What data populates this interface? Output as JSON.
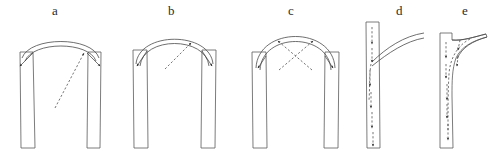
{
  "figure": {
    "background_color": "#ffffff",
    "line_color": "#4a4a4a",
    "masonry_stroke_color": "#5a5a5a",
    "arrow_color": "#2a2a2a",
    "label_color": "#2b2b2b",
    "width": 489,
    "height": 162
  },
  "panels": [
    {
      "id": "a",
      "label": "a",
      "label_x": 52,
      "label_y": 4,
      "type": "round-arch-on-piers",
      "description": "Shallow round arch spanning two vertical piers with thrust arrows pointing outward and downward at the springings and a single dashed thrust line from mid-span to the right haunch",
      "arrow_count": 3,
      "dashed_arrow_count": 1
    },
    {
      "id": "b",
      "label": "b",
      "label_x": 168,
      "label_y": 4,
      "type": "pointed-arch-on-piers",
      "description": "Steeper double-ribbed arch on two piers with outward thrust arrows at both springings and a dashed arrow from mid-span to the right haunch",
      "arrow_count": 3,
      "dashed_arrow_count": 1
    },
    {
      "id": "c",
      "label": "c",
      "label_x": 288,
      "label_y": 4,
      "type": "pointed-arch-crossed-thrusts",
      "description": "Tall pointed double-ribbed arch on two piers with two dashed thrust arrows crossing in an X pattern plus outward arrows at the springings",
      "arrow_count": 4,
      "dashed_arrow_count": 2
    },
    {
      "id": "d",
      "label": "d",
      "label_x": 396,
      "label_y": 4,
      "type": "single-pier-vertical-load",
      "description": "Single slender pier with arch ribs springing to the right; a column of dashed vertical arrows inside the pier indicates the descending load path",
      "arrow_count": 6,
      "dashed_arrow_count": 6
    },
    {
      "id": "e",
      "label": "e",
      "label_x": 462,
      "label_y": 4,
      "type": "single-pier-with-haunch",
      "description": "Single pier with a concave haunch fillet joining the arch rib; dashed vertical arrows inside the pier plus an arrow along the haunch show load transfer",
      "arrow_count": 7,
      "dashed_arrow_count": 7
    }
  ]
}
